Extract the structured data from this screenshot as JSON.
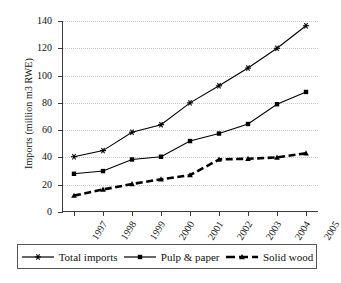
{
  "chart_data": {
    "type": "line",
    "title": "",
    "xlabel": "",
    "ylabel": "Imports (million m3 RWE)",
    "categories": [
      "1997",
      "1998",
      "1999",
      "2000",
      "2001",
      "2002",
      "2003",
      "2004",
      "2005"
    ],
    "ylim": [
      0,
      140
    ],
    "ytick_values": [
      0,
      20,
      40,
      60,
      80,
      100,
      120,
      140
    ],
    "ytick_labels": [
      "0",
      "20",
      "40",
      "60",
      "80",
      "100",
      "120",
      "140"
    ],
    "grid": "horizontal-dotted",
    "legend_position": "bottom",
    "series": [
      {
        "name": "Total imports",
        "marker": "star",
        "line_style": "solid",
        "color": "#000000",
        "values": [
          40.5,
          45.0,
          58.5,
          64.0,
          80.0,
          92.5,
          105.5,
          120.0,
          136.5
        ]
      },
      {
        "name": "Pulp & paper",
        "marker": "square",
        "line_style": "solid",
        "color": "#000000",
        "values": [
          28.0,
          30.0,
          38.5,
          40.5,
          52.0,
          57.5,
          64.5,
          79.0,
          88.0
        ]
      },
      {
        "name": "Solid wood",
        "marker": "triangle",
        "line_style": "dashed",
        "color": "#000000",
        "values": [
          12.0,
          16.5,
          20.5,
          24.0,
          27.0,
          38.5,
          39.0,
          40.0,
          43.0
        ]
      }
    ]
  },
  "legend": {
    "entries": [
      {
        "label": "Total  imports"
      },
      {
        "label": "Pulp & paper"
      },
      {
        "label": "Solid wood"
      }
    ]
  }
}
